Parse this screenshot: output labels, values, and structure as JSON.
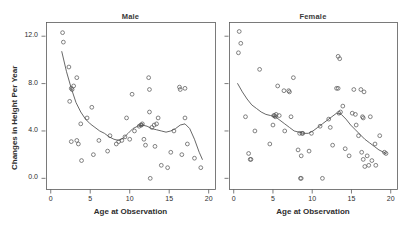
{
  "figure": {
    "y_axis_label": "Changes in Height Per Year",
    "panels": [
      {
        "title": "Male",
        "xlabel": "Age at Observation"
      },
      {
        "title": "Female",
        "xlabel": "Age at Observation"
      }
    ]
  },
  "chart_data": {
    "type": "scatter",
    "title": "",
    "layout": "two panels side by side, shared y-axis",
    "grid": false,
    "legend": null,
    "xlabel": "Age at Observation",
    "ylabel": "Changes in Height Per Year",
    "xlim": [
      -0.6,
      20.8
    ],
    "ylim": [
      -0.9,
      13.2
    ],
    "xticks": [
      0,
      5,
      10,
      15,
      20
    ],
    "yticks": [
      0.0,
      4.0,
      8.0,
      12.0
    ],
    "ytick_labels": [
      "0.0",
      "4.0",
      "8.0",
      "12.0"
    ],
    "xtick_labels": [
      "0",
      "5",
      "10",
      "15",
      "20"
    ],
    "marker": "open-circle",
    "panels": [
      {
        "name": "Male",
        "points": [
          [
            1.5,
            12.3
          ],
          [
            1.6,
            11.5
          ],
          [
            2.3,
            9.4
          ],
          [
            2.6,
            7.6
          ],
          [
            2.7,
            7.5
          ],
          [
            2.9,
            7.8
          ],
          [
            3.3,
            8.5
          ],
          [
            2.4,
            6.5
          ],
          [
            2.6,
            3.1
          ],
          [
            3.3,
            3.2
          ],
          [
            3.5,
            2.9
          ],
          [
            3.8,
            4.6
          ],
          [
            3.9,
            1.5
          ],
          [
            4.6,
            5.1
          ],
          [
            5.2,
            6.0
          ],
          [
            5.4,
            2.0
          ],
          [
            6.1,
            3.2
          ],
          [
            7.2,
            2.3
          ],
          [
            7.5,
            3.6
          ],
          [
            8.3,
            2.9
          ],
          [
            8.6,
            3.1
          ],
          [
            9.0,
            3.2
          ],
          [
            9.4,
            3.5
          ],
          [
            9.6,
            5.1
          ],
          [
            10.0,
            3.3
          ],
          [
            10.3,
            7.1
          ],
          [
            10.6,
            4.0
          ],
          [
            11.2,
            4.4
          ],
          [
            11.4,
            4.5
          ],
          [
            11.5,
            4.5
          ],
          [
            11.6,
            4.6
          ],
          [
            11.8,
            3.3
          ],
          [
            12.0,
            2.8
          ],
          [
            12.4,
            8.5
          ],
          [
            12.5,
            5.6
          ],
          [
            12.5,
            7.5
          ],
          [
            12.6,
            0.0
          ],
          [
            12.8,
            4.3
          ],
          [
            13.1,
            4.5
          ],
          [
            13.2,
            2.7
          ],
          [
            13.4,
            4.6
          ],
          [
            13.6,
            5.1
          ],
          [
            14.0,
            1.1
          ],
          [
            14.8,
            0.9
          ],
          [
            15.2,
            2.2
          ],
          [
            15.6,
            4.0
          ],
          [
            16.3,
            7.7
          ],
          [
            16.4,
            7.5
          ],
          [
            16.6,
            2.0
          ],
          [
            17.0,
            7.6
          ],
          [
            17.0,
            5.1
          ],
          [
            17.3,
            2.9
          ],
          [
            18.2,
            1.7
          ],
          [
            19.0,
            0.9
          ]
        ],
        "trend_curve": [
          [
            1.4,
            10.7
          ],
          [
            2.0,
            9.0
          ],
          [
            2.6,
            7.6
          ],
          [
            3.2,
            6.4
          ],
          [
            3.8,
            5.6
          ],
          [
            4.4,
            5.0
          ],
          [
            5.0,
            4.6
          ],
          [
            5.6,
            4.3
          ],
          [
            6.2,
            4.0
          ],
          [
            6.8,
            3.8
          ],
          [
            7.4,
            3.5
          ],
          [
            8.0,
            3.3
          ],
          [
            8.6,
            3.2
          ],
          [
            9.2,
            3.4
          ],
          [
            9.8,
            3.8
          ],
          [
            10.4,
            4.2
          ],
          [
            11.0,
            4.4
          ],
          [
            11.6,
            4.5
          ],
          [
            12.2,
            4.4
          ],
          [
            12.8,
            4.2
          ],
          [
            13.4,
            4.1
          ],
          [
            14.0,
            4.0
          ],
          [
            14.6,
            3.9
          ],
          [
            15.2,
            4.0
          ],
          [
            15.8,
            4.2
          ],
          [
            16.4,
            4.5
          ],
          [
            17.0,
            4.6
          ],
          [
            17.6,
            4.2
          ],
          [
            18.2,
            3.3
          ],
          [
            18.8,
            2.2
          ],
          [
            19.2,
            1.6
          ]
        ]
      },
      {
        "name": "Female",
        "points": [
          [
            0.7,
            12.4
          ],
          [
            0.9,
            11.4
          ],
          [
            0.6,
            10.6
          ],
          [
            1.9,
            2.1
          ],
          [
            2.1,
            1.6
          ],
          [
            2.2,
            1.6
          ],
          [
            3.3,
            9.2
          ],
          [
            1.5,
            5.2
          ],
          [
            2.7,
            4.0
          ],
          [
            5.1,
            5.3
          ],
          [
            5.2,
            5.3
          ],
          [
            5.3,
            5.2
          ],
          [
            5.4,
            5.4
          ],
          [
            5.6,
            7.8
          ],
          [
            5.8,
            5.3
          ],
          [
            4.6,
            2.9
          ],
          [
            5.0,
            4.5
          ],
          [
            6.4,
            7.4
          ],
          [
            7.0,
            7.4
          ],
          [
            7.1,
            7.3
          ],
          [
            7.3,
            5.2
          ],
          [
            6.5,
            4.0
          ],
          [
            7.6,
            8.5
          ],
          [
            8.4,
            3.8
          ],
          [
            8.5,
            0.0
          ],
          [
            8.6,
            0.0
          ],
          [
            8.7,
            3.8
          ],
          [
            8.8,
            3.8
          ],
          [
            8.2,
            2.4
          ],
          [
            8.6,
            1.9
          ],
          [
            9.9,
            3.8
          ],
          [
            9.6,
            2.3
          ],
          [
            11.0,
            4.4
          ],
          [
            11.3,
            0.0
          ],
          [
            12.1,
            5.0
          ],
          [
            12.3,
            4.3
          ],
          [
            12.6,
            2.8
          ],
          [
            13.3,
            10.3
          ],
          [
            13.5,
            10.1
          ],
          [
            13.1,
            7.6
          ],
          [
            13.3,
            7.6
          ],
          [
            13.4,
            5.5
          ],
          [
            13.6,
            5.6
          ],
          [
            13.9,
            6.1
          ],
          [
            14.2,
            2.5
          ],
          [
            14.7,
            1.9
          ],
          [
            15.1,
            5.5
          ],
          [
            15.3,
            7.5
          ],
          [
            15.5,
            5.4
          ],
          [
            15.6,
            4.5
          ],
          [
            15.9,
            3.6
          ],
          [
            16.2,
            7.5
          ],
          [
            16.4,
            5.2
          ],
          [
            16.5,
            5.1
          ],
          [
            16.6,
            7.3
          ],
          [
            16.3,
            2.2
          ],
          [
            16.5,
            1.6
          ],
          [
            16.7,
            1.0
          ],
          [
            17.0,
            1.9
          ],
          [
            17.2,
            1.1
          ],
          [
            17.4,
            5.2
          ],
          [
            17.6,
            1.5
          ],
          [
            18.0,
            2.9
          ],
          [
            18.1,
            1.1
          ],
          [
            18.6,
            3.6
          ],
          [
            19.2,
            2.2
          ],
          [
            19.4,
            2.1
          ]
        ],
        "trend_curve": [
          [
            0.5,
            8.0
          ],
          [
            1.1,
            7.3
          ],
          [
            1.7,
            6.7
          ],
          [
            2.3,
            6.2
          ],
          [
            2.9,
            5.9
          ],
          [
            3.5,
            5.6
          ],
          [
            4.1,
            5.4
          ],
          [
            4.7,
            5.3
          ],
          [
            5.3,
            5.2
          ],
          [
            5.9,
            4.9
          ],
          [
            6.5,
            4.6
          ],
          [
            7.1,
            4.3
          ],
          [
            7.7,
            4.0
          ],
          [
            8.3,
            3.9
          ],
          [
            8.9,
            3.8
          ],
          [
            9.5,
            3.8
          ],
          [
            10.1,
            4.0
          ],
          [
            10.7,
            4.3
          ],
          [
            11.3,
            4.6
          ],
          [
            11.9,
            4.9
          ],
          [
            12.5,
            5.2
          ],
          [
            13.1,
            5.5
          ],
          [
            13.7,
            5.4
          ],
          [
            14.3,
            5.0
          ],
          [
            14.9,
            4.5
          ],
          [
            15.5,
            4.1
          ],
          [
            16.1,
            3.7
          ],
          [
            16.7,
            3.3
          ],
          [
            17.3,
            3.0
          ],
          [
            17.9,
            2.7
          ],
          [
            18.5,
            2.4
          ],
          [
            19.1,
            2.2
          ],
          [
            19.4,
            2.1
          ]
        ]
      }
    ]
  }
}
